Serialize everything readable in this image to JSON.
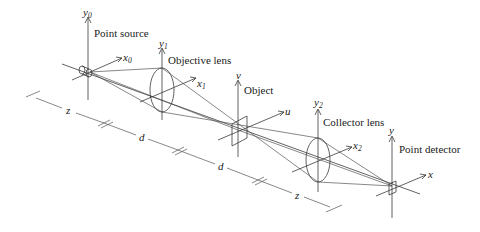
{
  "figure": {
    "type": "confocal scanning microscope geometry",
    "components": [
      {
        "id": "point-source",
        "label": "Point source",
        "y_axis": "y",
        "y_sub": "0",
        "x_axis": "x",
        "x_sub": "0"
      },
      {
        "id": "objective-lens",
        "label": "Objective lens",
        "y_axis": "y",
        "y_sub": "1",
        "x_axis": "x",
        "x_sub": "1"
      },
      {
        "id": "object",
        "label": "Object",
        "y_axis": "v",
        "y_sub": "",
        "x_axis": "u",
        "x_sub": ""
      },
      {
        "id": "collector-lens",
        "label": "Collector lens",
        "y_axis": "y",
        "y_sub": "2",
        "x_axis": "x",
        "x_sub": "2"
      },
      {
        "id": "point-detector",
        "label": "Point detector",
        "y_axis": "y",
        "y_sub": "",
        "x_axis": "x",
        "x_sub": ""
      }
    ],
    "distances": [
      {
        "label": "z"
      },
      {
        "label": "d"
      },
      {
        "label": "d"
      },
      {
        "label": "z"
      }
    ]
  }
}
